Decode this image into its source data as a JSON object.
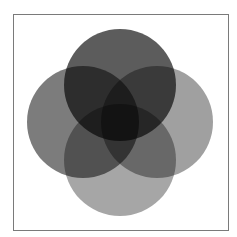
{
  "diagram": {
    "type": "venn",
    "set_count": 4,
    "frame": {
      "x": 13,
      "y": 14,
      "width": 216,
      "height": 217,
      "border_color": "#7a7a7a"
    },
    "circles": [
      {
        "name": "left-circle",
        "cx": 83,
        "cy": 122,
        "r": 56,
        "color": "#7c7c7c"
      },
      {
        "name": "bottom-circle",
        "cx": 120,
        "cy": 160,
        "r": 56,
        "color": "#a6a6a6"
      },
      {
        "name": "right-circle",
        "cx": 157,
        "cy": 122,
        "r": 56,
        "color": "#a0a0a0"
      },
      {
        "name": "top-circle",
        "cx": 120,
        "cy": 85,
        "r": 56,
        "color": "#5c5c5c"
      }
    ],
    "labels": []
  }
}
